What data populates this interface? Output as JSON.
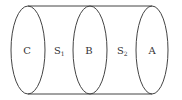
{
  "diagram": {
    "type": "cylinder-with-cross-sections",
    "stroke_color": "#444444",
    "background": "#ffffff",
    "cross_sections": [
      {
        "label": "C"
      },
      {
        "label": "B"
      },
      {
        "label": "A"
      }
    ],
    "regions": [
      {
        "label": "S",
        "subscript": "1"
      },
      {
        "label": "S",
        "subscript": "2"
      }
    ]
  }
}
